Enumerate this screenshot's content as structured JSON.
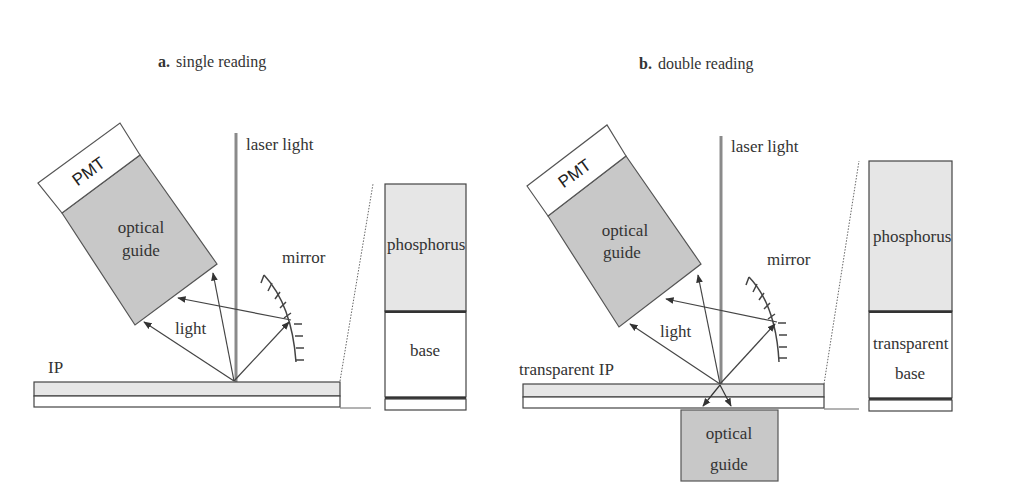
{
  "figure": {
    "panels": [
      {
        "id": "a",
        "title_letter": "a.",
        "title_text": "single reading",
        "labels": {
          "pmt": "PMT",
          "guide_line1": "optical",
          "guide_line2": "guide",
          "laser": "laser light",
          "mirror": "mirror",
          "light": "light",
          "plate": "IP",
          "inset_top": "phosphorus",
          "inset_bottom_line1": "base",
          "inset_bottom_line2": ""
        }
      },
      {
        "id": "b",
        "title_letter": "b.",
        "title_text": "double reading",
        "labels": {
          "pmt": "PMT",
          "guide_line1": "optical",
          "guide_line2": "guide",
          "laser": "laser light",
          "mirror": "mirror",
          "light": "light",
          "plate": "transparent IP",
          "inset_top": "phosphorus",
          "inset_bottom_line1": "transparent",
          "inset_bottom_line2": "base",
          "lower_guide_line1": "optical",
          "lower_guide_line2": "guide"
        }
      }
    ],
    "colors": {
      "guide_fill": "#c8c8c8",
      "phosphor_fill": "#e6e6e6",
      "line": "#444444",
      "laser": "#8a8a8a"
    }
  }
}
